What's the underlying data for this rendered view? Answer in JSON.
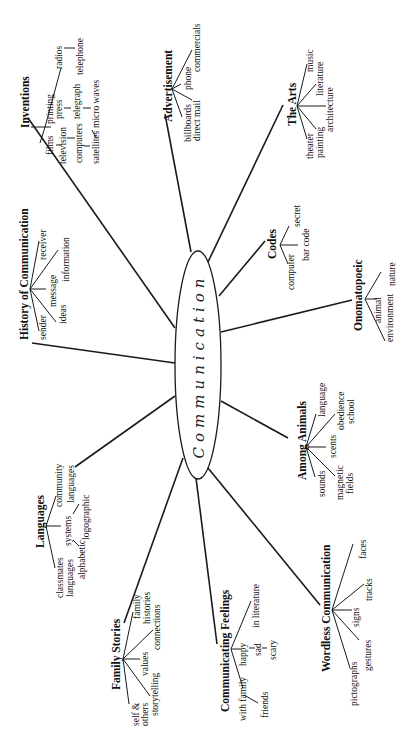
{
  "center": {
    "label": "Communication"
  },
  "topics": [
    {
      "id": "inventions",
      "label": "Inventions",
      "items": [
        "films",
        "television",
        "computers",
        "satellites",
        "micro waves",
        "printing",
        "press",
        "telegraph",
        "radios",
        "telephone"
      ]
    },
    {
      "id": "advertisement",
      "label": "Advertisement",
      "items": [
        "billboards",
        "direct mail",
        "phone",
        "commercials"
      ]
    },
    {
      "id": "the-arts",
      "label": "The Arts",
      "items": [
        "theater",
        "painting",
        "architecture",
        "literature",
        "music"
      ]
    },
    {
      "id": "history",
      "label": "History of Communication",
      "items": [
        "sender",
        "ideas",
        "message",
        "information",
        "receiver"
      ]
    },
    {
      "id": "codes",
      "label": "Codes",
      "items": [
        "computer",
        "bar code",
        "secret"
      ]
    },
    {
      "id": "onomatopoeic",
      "label": "Onomatopoeic",
      "items": [
        "environment",
        "animal",
        "nature"
      ]
    },
    {
      "id": "languages",
      "label": "Languages",
      "items": [
        "classmates",
        "languages",
        "alphabetic",
        "systems",
        "logographic",
        "community",
        "languages"
      ]
    },
    {
      "id": "among-animals",
      "label": "Among Animals",
      "items": [
        "sounds",
        "magnetic",
        "fields",
        "scents",
        "obedience",
        "school",
        "language"
      ]
    },
    {
      "id": "family-stories",
      "label": "Family Stories",
      "items": [
        "self &",
        "others",
        "storytelling",
        "values",
        "connections",
        "family",
        "histories"
      ]
    },
    {
      "id": "communicating-feelings",
      "label": "Communicating Feelings",
      "items": [
        "with family",
        "friends",
        "happy",
        "sad",
        "scary",
        "in literature"
      ]
    },
    {
      "id": "wordless",
      "label": "Wordless Communication",
      "items": [
        "pictographs",
        "gestures",
        "signs",
        "tracks",
        "faces"
      ]
    }
  ]
}
